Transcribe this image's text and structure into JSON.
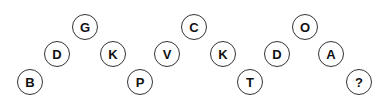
{
  "puzzle": {
    "nodes": [
      {
        "label": "B",
        "x": 30,
        "y": 82
      },
      {
        "label": "D",
        "x": 57,
        "y": 54
      },
      {
        "label": "G",
        "x": 85,
        "y": 27
      },
      {
        "label": "K",
        "x": 113,
        "y": 54
      },
      {
        "label": "P",
        "x": 140,
        "y": 82
      },
      {
        "label": "V",
        "x": 167,
        "y": 54
      },
      {
        "label": "C",
        "x": 194,
        "y": 27
      },
      {
        "label": "K",
        "x": 223,
        "y": 54
      },
      {
        "label": "T",
        "x": 250,
        "y": 82
      },
      {
        "label": "D",
        "x": 277,
        "y": 54
      },
      {
        "label": "O",
        "x": 305,
        "y": 27
      },
      {
        "label": "A",
        "x": 331,
        "y": 54
      },
      {
        "label": "?",
        "x": 359,
        "y": 82
      }
    ]
  }
}
